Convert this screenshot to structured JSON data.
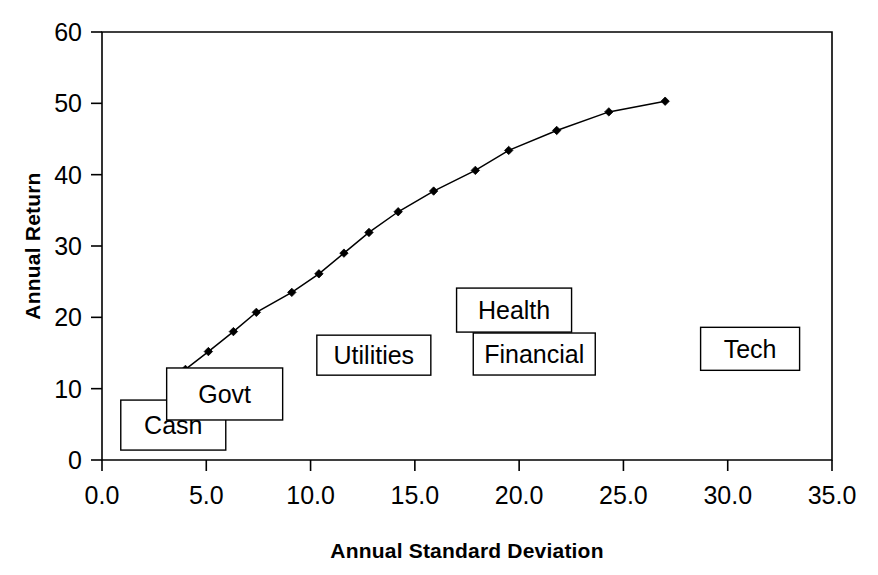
{
  "chart_data": {
    "type": "line",
    "title": "",
    "subtitle": "",
    "xlabel": "Annual Standard Deviation",
    "ylabel": "Annual Return",
    "xlim": [
      0.0,
      35.0
    ],
    "ylim": [
      0,
      60
    ],
    "grid": false,
    "legend_position": "none",
    "x_ticks": [
      "0.0",
      "5.0",
      "10.0",
      "15.0",
      "20.0",
      "25.0",
      "30.0",
      "35.0"
    ],
    "x_tick_values": [
      0.0,
      5.0,
      10.0,
      15.0,
      20.0,
      25.0,
      30.0,
      35.0
    ],
    "y_ticks": [
      "0",
      "10",
      "20",
      "30",
      "40",
      "50",
      "60"
    ],
    "y_tick_values": [
      0,
      10,
      20,
      30,
      40,
      50,
      60
    ],
    "marker_style": "diamond",
    "series": [
      {
        "name": "Efficient Frontier",
        "x": [
          4.0,
          5.1,
          6.3,
          7.4,
          9.1,
          10.4,
          11.6,
          12.8,
          14.2,
          15.9,
          17.9,
          19.5,
          21.8,
          24.3,
          27.0
        ],
        "values": [
          12.7,
          15.2,
          18.0,
          20.7,
          23.5,
          26.1,
          29.0,
          31.9,
          34.8,
          37.7,
          40.6,
          43.4,
          46.2,
          48.8,
          50.3
        ]
      }
    ],
    "annotations": [
      {
        "label": "Cash",
        "x": 0.9,
        "y": 8.4,
        "box_w": 105,
        "box_h": 50
      },
      {
        "label": "Govt",
        "x": 3.1,
        "y": 12.9,
        "box_w": 116,
        "box_h": 52
      },
      {
        "label": "Utilities",
        "x": 10.3,
        "y": 17.5,
        "box_w": 114,
        "box_h": 40
      },
      {
        "label": "Health",
        "x": 17.0,
        "y": 24.1,
        "box_w": 115,
        "box_h": 44
      },
      {
        "label": "Financial",
        "x": 17.8,
        "y": 17.8,
        "box_w": 122,
        "box_h": 42
      },
      {
        "label": "Tech",
        "x": 28.7,
        "y": 18.6,
        "box_w": 99,
        "box_h": 43
      }
    ]
  },
  "colors": {
    "line": "#000000",
    "marker": "#000000",
    "axis": "#000000",
    "background": "#ffffff",
    "callout_fill": "#ffffff",
    "callout_stroke": "#000000"
  },
  "geometry": {
    "plot_left": 102,
    "plot_right": 832,
    "plot_top": 32,
    "plot_bottom": 460
  }
}
